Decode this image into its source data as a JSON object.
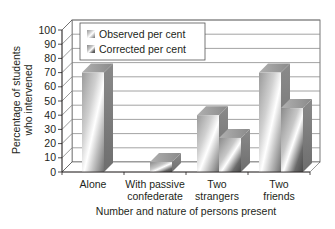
{
  "chart_data": {
    "type": "bar",
    "subtype": "3d-clustered-column",
    "title": "",
    "xlabel": "Number and nature of persons present",
    "ylabel": "Percentage of students who intervened",
    "ylabel_lines": [
      "Percentage of students",
      "who intervened"
    ],
    "categories": [
      "Alone",
      "With passive confederate",
      "Two strangers",
      "Two friends"
    ],
    "category_lines": [
      [
        "Alone"
      ],
      [
        "With passive",
        "confederate"
      ],
      [
        "Two",
        "strangers"
      ],
      [
        "Two",
        "friends"
      ]
    ],
    "series": [
      {
        "name": "Observed per cent",
        "values": [
          70,
          null,
          40,
          70
        ]
      },
      {
        "name": "Corrected per cent",
        "values": [
          null,
          7,
          24,
          45
        ]
      }
    ],
    "ylim": [
      0,
      100
    ],
    "yticks": [
      0,
      10,
      20,
      30,
      40,
      50,
      60,
      70,
      80,
      90,
      100
    ],
    "grid": true,
    "legend_position": "top-left inside plot"
  },
  "legend": {
    "items": [
      "Observed per cent",
      "Corrected per cent"
    ]
  },
  "colors": {
    "bar_light": "#f2f2f2",
    "bar_mid": "#b5b5b5",
    "bar_dark": "#7a7a7a",
    "grid": "#8c8c8c",
    "axis": "#231f20"
  }
}
